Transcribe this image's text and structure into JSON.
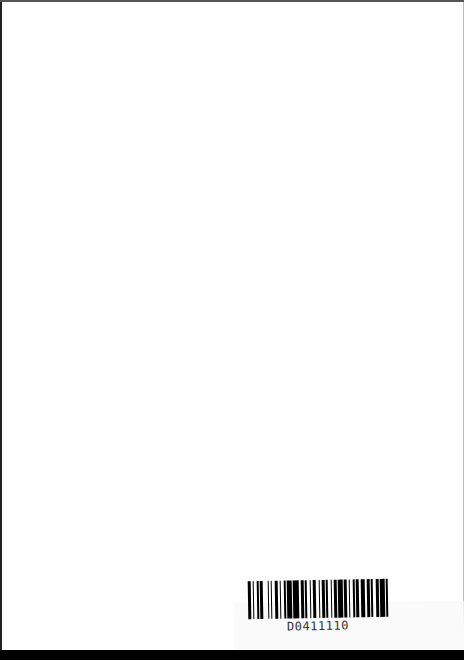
{
  "document": {
    "type": "scanned blank page",
    "label": {
      "barcode_text": "D0411110",
      "bars": [
        2,
        1,
        1,
        2,
        1,
        1,
        2,
        3,
        1,
        1,
        1,
        2,
        2,
        1,
        1,
        2,
        1,
        1,
        3,
        1,
        4,
        1,
        2,
        1,
        1,
        2,
        1,
        1,
        2,
        2,
        1,
        1,
        2,
        1,
        1,
        2,
        1,
        1,
        2,
        1,
        3,
        1,
        2,
        1,
        1,
        2,
        1,
        1,
        2,
        1,
        3,
        1,
        2,
        1,
        1,
        2,
        2,
        1,
        3,
        1,
        1
      ]
    }
  }
}
